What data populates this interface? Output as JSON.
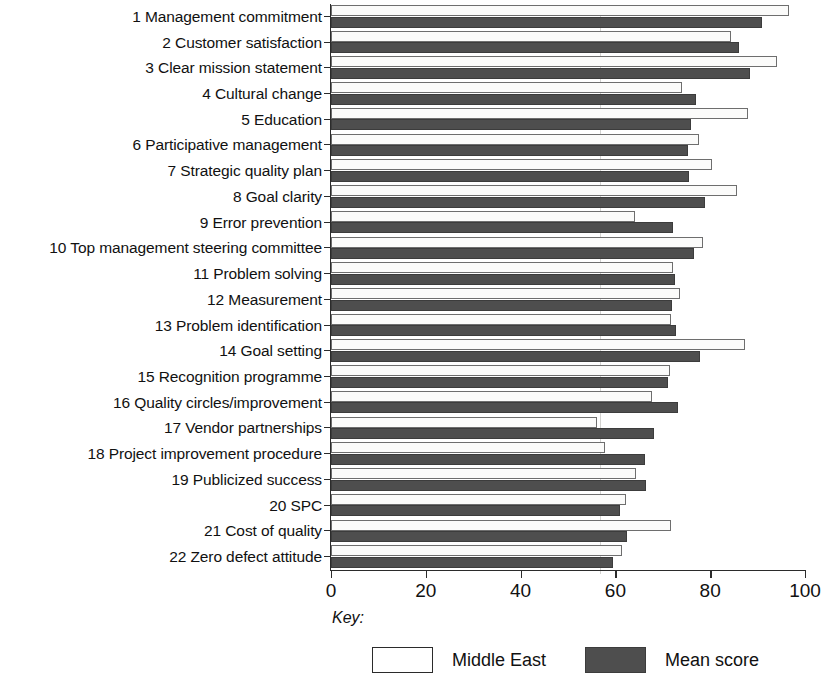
{
  "chart": {
    "type": "bar",
    "orientation": "horizontal",
    "title": "",
    "xlabel": "",
    "ylabel": "",
    "key_label": "Key:",
    "legend": [
      {
        "name": "Middle East",
        "swatch": "light",
        "color": "#ffffff"
      },
      {
        "name": "Mean score",
        "swatch": "dark",
        "color": "#4e4e4e"
      }
    ]
  },
  "axis": {
    "xlim": [
      0,
      100
    ],
    "xticks": [
      0,
      20,
      40,
      60,
      80,
      100
    ],
    "xtick_labels": [
      "0",
      "20",
      "40",
      "60",
      "80",
      "100"
    ],
    "grid": false
  },
  "chart_data": {
    "type": "bar",
    "orientation": "horizontal",
    "title": "",
    "xlabel": "",
    "ylabel": "",
    "xlim": [
      0,
      100
    ],
    "xticks": [
      0,
      20,
      40,
      60,
      80,
      100
    ],
    "grid": false,
    "legend_position": "bottom",
    "categories": [
      "1 Management commitment",
      "2 Customer satisfaction",
      "3 Clear mission statement",
      "4 Cultural change",
      "5 Education",
      "6 Participative management",
      "7 Strategic quality plan",
      "8 Goal clarity",
      "9 Error prevention",
      "10 Top management steering committee",
      "11 Problem solving",
      "12 Measurement",
      "13 Problem identification",
      "14 Goal setting",
      "15 Recognition programme",
      "16 Quality circles/improvement",
      "17 Vendor partnerships",
      "18 Project improvement procedure",
      "19 Publicized success",
      "20 SPC",
      "21 Cost of quality",
      "22 Zero defect attitude"
    ],
    "series": [
      {
        "name": "Middle East",
        "color": "#ffffff",
        "values": [
          96.6,
          84.4,
          94.1,
          74.0,
          88.0,
          77.6,
          80.3,
          85.7,
          64.1,
          78.5,
          72.2,
          73.6,
          71.7,
          87.4,
          71.5,
          67.7,
          56.1,
          57.8,
          64.3,
          62.2,
          71.7,
          61.4
        ]
      },
      {
        "name": "Mean score",
        "color": "#4e4e4e",
        "values": [
          90.9,
          86.1,
          88.4,
          77.0,
          75.9,
          75.3,
          75.5,
          78.9,
          72.2,
          76.6,
          72.6,
          71.9,
          72.8,
          77.8,
          71.1,
          73.2,
          68.1,
          66.2,
          66.5,
          61.0,
          62.4,
          59.5
        ]
      }
    ]
  }
}
